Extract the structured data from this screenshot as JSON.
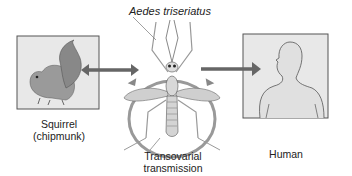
{
  "diagram": {
    "title": "Aedes triseriatus",
    "nodes": [
      {
        "id": "squirrel",
        "label_line1": "Squirrel",
        "label_line2": "(chipmunk)"
      },
      {
        "id": "mosquito",
        "label_line1": "Transovarial",
        "label_line2": "transmission"
      },
      {
        "id": "human",
        "label": "Human"
      }
    ],
    "edges": [
      {
        "from": "squirrel",
        "to": "mosquito",
        "type": "bidirectional"
      },
      {
        "from": "mosquito",
        "to": "human",
        "type": "unidirectional"
      },
      {
        "from": "mosquito",
        "to": "mosquito",
        "type": "cycle",
        "label": "Transovarial transmission"
      }
    ],
    "colors": {
      "panel_fill": "#e6e6e6",
      "panel_border": "#555555",
      "arrow": "#666666",
      "cycle_ring": "#9a9a9a"
    }
  }
}
